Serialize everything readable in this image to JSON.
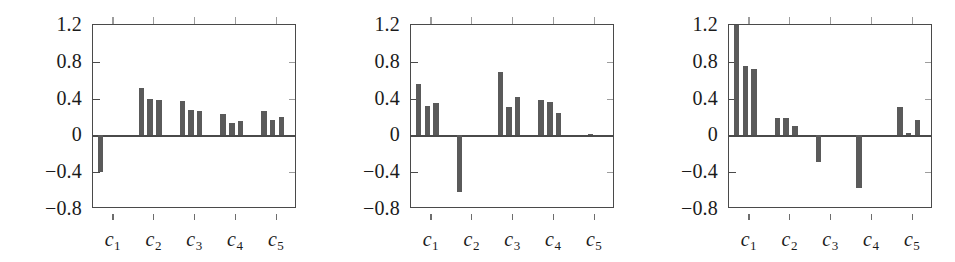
{
  "figure": {
    "panel_count": 3,
    "bars_per_group": 3,
    "bar_color": "#5a5a5a",
    "axis_color": "#4a4a4a"
  },
  "chart_data": [
    {
      "type": "bar",
      "title": "",
      "xlabel": "",
      "ylabel": "",
      "categories": [
        "c1",
        "c2",
        "c3",
        "c4",
        "c5"
      ],
      "category_labels": [
        "c",
        "c",
        "c",
        "c",
        "c"
      ],
      "category_subscripts": [
        "1",
        "2",
        "3",
        "4",
        "5"
      ],
      "ylim": [
        -0.8,
        1.2
      ],
      "yticks": [
        1.2,
        0.8,
        0.4,
        0,
        -0.4,
        -0.8
      ],
      "ytick_labels": [
        "1.2",
        "0.8",
        "0.4",
        "0",
        "−0.4",
        "−0.8"
      ],
      "grid": false,
      "legend": "none",
      "series": [
        {
          "name": "series-1",
          "values": [
            -0.4,
            0.52,
            0.37,
            0.23,
            0.27
          ]
        },
        {
          "name": "series-2",
          "values": [
            0.0,
            0.4,
            0.28,
            0.14,
            0.17
          ]
        },
        {
          "name": "series-3",
          "values": [
            0.0,
            0.38,
            0.26,
            0.16,
            0.2
          ]
        }
      ]
    },
    {
      "type": "bar",
      "title": "",
      "xlabel": "",
      "ylabel": "",
      "categories": [
        "c1",
        "c2",
        "c3",
        "c4",
        "c5"
      ],
      "category_labels": [
        "c",
        "c",
        "c",
        "c",
        "c"
      ],
      "category_subscripts": [
        "1",
        "2",
        "3",
        "4",
        "5"
      ],
      "ylim": [
        -0.8,
        1.2
      ],
      "yticks": [
        1.2,
        0.8,
        0.4,
        0,
        -0.4,
        -0.8
      ],
      "ytick_labels": [
        "1.2",
        "0.8",
        "0.4",
        "0",
        "−0.4",
        "−0.8"
      ],
      "grid": false,
      "legend": "none",
      "series": [
        {
          "name": "series-1",
          "values": [
            0.56,
            -0.62,
            0.69,
            0.39,
            0.0
          ]
        },
        {
          "name": "series-2",
          "values": [
            0.32,
            0.0,
            0.31,
            0.36,
            0.02
          ]
        },
        {
          "name": "series-3",
          "values": [
            0.35,
            0.0,
            0.42,
            0.24,
            0.0
          ]
        }
      ]
    },
    {
      "type": "bar",
      "title": "",
      "xlabel": "",
      "ylabel": "",
      "categories": [
        "c1",
        "c2",
        "c3",
        "c4",
        "c5"
      ],
      "category_labels": [
        "c",
        "c",
        "c",
        "c",
        "c"
      ],
      "category_subscripts": [
        "1",
        "2",
        "3",
        "4",
        "5"
      ],
      "ylim": [
        -0.8,
        1.2
      ],
      "yticks": [
        1.2,
        0.8,
        0.4,
        0,
        -0.4,
        -0.8
      ],
      "ytick_labels": [
        "1.2",
        "0.8",
        "0.4",
        "0",
        "−0.4",
        "−0.8"
      ],
      "grid": false,
      "legend": "none",
      "series": [
        {
          "name": "series-1",
          "values": [
            1.22,
            0.19,
            -0.29,
            -0.57,
            0.31
          ]
        },
        {
          "name": "series-2",
          "values": [
            0.75,
            0.19,
            0.0,
            0.0,
            0.03
          ]
        },
        {
          "name": "series-3",
          "values": [
            0.72,
            0.1,
            0.0,
            0.0,
            0.17
          ]
        }
      ]
    }
  ]
}
